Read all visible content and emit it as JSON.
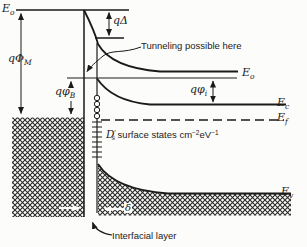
{
  "colors": {
    "ink": "#1a1a1a",
    "hatch": "#2a2a2a",
    "background": "#fcfcfa"
  },
  "diagram": {
    "energy_levels": {
      "vacuum_metal": {
        "base": "E",
        "sub": "o"
      },
      "vacuum_semiconductor": {
        "base": "E",
        "sub": "o"
      },
      "conduction_band": {
        "base": "E",
        "sub": "c"
      },
      "fermi_level": {
        "base": "E",
        "sub": "f"
      },
      "valence_band": {
        "base": "E",
        "sub": "v"
      }
    },
    "dimensions": {
      "metal_work_function": {
        "prefix": "q",
        "symbol": "Φ",
        "sub": "M"
      },
      "interfacial_potential_drop": {
        "prefix": "q",
        "symbol": "Δ"
      },
      "barrier_height": {
        "prefix": "q",
        "symbol": "φ",
        "sub": "B"
      },
      "band_bending": {
        "prefix": "q",
        "symbol": "φ",
        "sub": "i"
      },
      "layer_thickness": {
        "symbol": "δ"
      }
    },
    "annotations": {
      "tunneling": "Tunneling possible here",
      "interfacial_layer": "Interfacial layer",
      "surface_states": {
        "symbol_base": "D",
        "symbol_prime": "′",
        "symbol_sub": "s",
        "label": " surface states ",
        "unit1": "cm",
        "unit1_exp": "−2",
        "unit2": "eV",
        "unit2_exp": "−1"
      }
    }
  }
}
